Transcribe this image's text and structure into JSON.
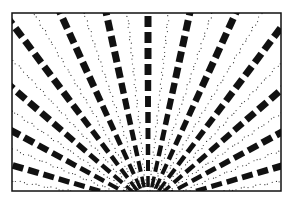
{
  "figure": {
    "frame": {
      "x": 12,
      "y": 13,
      "width": 269,
      "height": 178,
      "stroke": "#111111"
    },
    "origin": {
      "x": 148,
      "y": 205
    },
    "rays": {
      "count": 15,
      "angle_start": -176,
      "angle_end": -4
    },
    "dash": {
      "color": "#111111",
      "length": 11,
      "gap": 5,
      "width_min": 3,
      "width_max": 7,
      "start_radius": 18
    },
    "dots": {
      "color": "#333333",
      "spacing": 4,
      "radius": 0.6
    }
  }
}
